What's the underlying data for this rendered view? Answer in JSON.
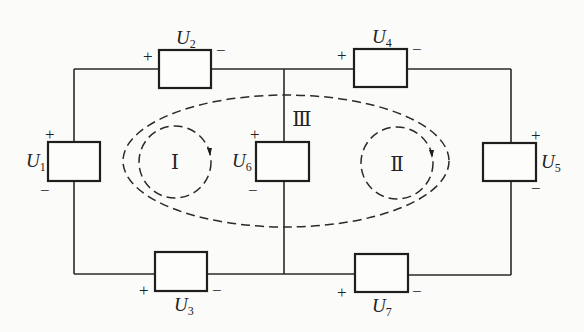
{
  "diagram": {
    "title": "",
    "elements": [
      {
        "id": "U1",
        "symbol": "U",
        "subscript": "1",
        "plus": "+",
        "minus": "−"
      },
      {
        "id": "U2",
        "symbol": "U",
        "subscript": "2",
        "plus": "+",
        "minus": "−"
      },
      {
        "id": "U3",
        "symbol": "U",
        "subscript": "3",
        "plus": "+",
        "minus": "−"
      },
      {
        "id": "U4",
        "symbol": "U",
        "subscript": "4",
        "plus": "+",
        "minus": "−"
      },
      {
        "id": "U5",
        "symbol": "U",
        "subscript": "5",
        "plus": "+",
        "minus": "−"
      },
      {
        "id": "U6",
        "symbol": "U",
        "subscript": "6",
        "plus": "+",
        "minus": "−"
      },
      {
        "id": "U7",
        "symbol": "U",
        "subscript": "7",
        "plus": "+",
        "minus": "−"
      }
    ],
    "loops": [
      {
        "id": "I",
        "label": "Ⅰ",
        "direction": "clockwise"
      },
      {
        "id": "II",
        "label": "Ⅱ",
        "direction": "clockwise"
      },
      {
        "id": "III",
        "label": "Ⅲ",
        "direction": "clockwise"
      }
    ],
    "colors": {
      "line": "#2a2a2a",
      "background": "#fbfbfa"
    }
  }
}
